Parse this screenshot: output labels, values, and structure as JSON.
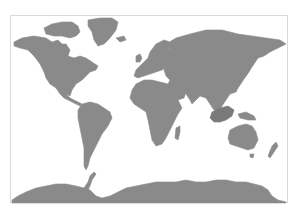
{
  "map": {
    "type": "world-map",
    "projection": "cylindrical (Miller-like)",
    "land_color": "#8a8a8a",
    "land_dark_color": "#7a7a7a",
    "water_color": "#ffffff",
    "frame_color": "#d9d9d9",
    "frame": {
      "x": 10,
      "y": 15,
      "width": 278,
      "height": 188
    },
    "regions": [
      {
        "name": "north-america",
        "dark": false,
        "points": "14,42 22,38 34,36 46,38 52,42 58,40 62,44 66,44 70,50 68,56 74,58 80,56 86,58 92,62 98,66 96,70 90,72 86,76 82,80 76,84 72,90 70,96 66,94 62,90 56,88 50,84 46,78 44,72 40,64 34,56 28,50 20,48 14,46"
      },
      {
        "name": "central-america",
        "dark": false,
        "points": "56,88 62,90 66,94 70,98 74,100 78,102 82,104 80,106 76,104 72,102 68,100 64,98 60,94"
      },
      {
        "name": "canadian-arctic-islands",
        "dark": false,
        "points": "44,28 52,24 62,22 72,22 78,26 80,32 76,36 70,38 62,36 54,36 46,34"
      },
      {
        "name": "greenland",
        "dark": false,
        "points": "88,20 100,18 112,18 118,22 116,30 110,38 104,44 98,46 94,40 92,32 88,26"
      },
      {
        "name": "south-america",
        "dark": false,
        "points": "82,104 90,102 98,104 104,108 110,112 112,118 108,126 102,134 98,142 94,150 90,158 88,166 86,170 84,166 84,158 84,148 82,138 80,128 78,118 78,110"
      },
      {
        "name": "europe",
        "dark": false,
        "points": "134,76 136,70 140,66 144,62 148,58 150,52 156,44 164,40 170,42 168,48 172,52 174,58 170,64 166,68 162,70 156,72 150,74 144,76 138,78"
      },
      {
        "name": "uk",
        "dark": false,
        "points": "136,56 140,54 142,58 140,62 136,62"
      },
      {
        "name": "iceland",
        "dark": false,
        "points": "116,38 124,36 126,40 120,42"
      },
      {
        "name": "asia",
        "dark": false,
        "points": "166,44 176,38 190,34 206,30 222,30 238,34 252,36 266,38 280,40 286,44 278,48 270,52 264,56 258,58 254,64 250,70 246,76 242,82 238,88 236,92 230,94 226,100 222,106 218,112 214,110 210,104 206,98 200,96 196,100 192,104 190,100 186,94 180,92 176,88 174,84 170,80 166,76 164,70 168,64 172,58 170,50"
      },
      {
        "name": "arabia",
        "dark": false,
        "points": "170,80 176,82 182,86 186,92 184,98 178,100 172,96 170,90 168,84"
      },
      {
        "name": "japan",
        "dark": false,
        "points": "244,66 248,64 250,70 246,76 242,78 242,72"
      },
      {
        "name": "africa",
        "dark": false,
        "points": "136,84 144,80 152,80 160,82 168,84 172,92 178,100 182,108 178,114 174,122 170,130 166,138 162,144 156,146 152,140 150,130 148,120 146,112 140,108 134,104 130,98 132,90"
      },
      {
        "name": "madagascar",
        "dark": false,
        "points": "176,128 180,126 180,132 178,140 175,138"
      },
      {
        "name": "southeast-asia-indonesia",
        "dark": true,
        "points": "212,112 220,108 228,106 234,110 232,116 226,120 220,122 214,122 210,118"
      },
      {
        "name": "new-guinea",
        "dark": false,
        "points": "238,114 246,112 254,116 256,120 248,120 240,118"
      },
      {
        "name": "australia",
        "dark": false,
        "points": "230,130 238,126 246,124 252,126 256,132 258,140 254,148 248,150 242,148 236,146 230,144 228,138"
      },
      {
        "name": "tasmania",
        "dark": false,
        "points": "250,154 254,154 253,158 250,157"
      },
      {
        "name": "new-zealand",
        "dark": false,
        "points": "272,146 276,142 278,146 274,152 270,158 268,156"
      },
      {
        "name": "antarctic-peninsula",
        "dark": false,
        "points": "84,188 88,182 90,176 94,172 96,174 92,180 90,186 88,190"
      },
      {
        "name": "antarctica",
        "dark": false,
        "points": "18,196 26,192 36,188 46,186 56,184 66,184 76,186 84,188 90,190 96,196 102,198 110,196 118,192 126,188 136,186 146,184 156,182 166,182 176,182 186,180 196,182 206,182 216,180 226,180 236,182 246,182 254,184 262,186 268,190 272,196 278,200 286,202 286,203 12,203 12,200"
      }
    ]
  }
}
